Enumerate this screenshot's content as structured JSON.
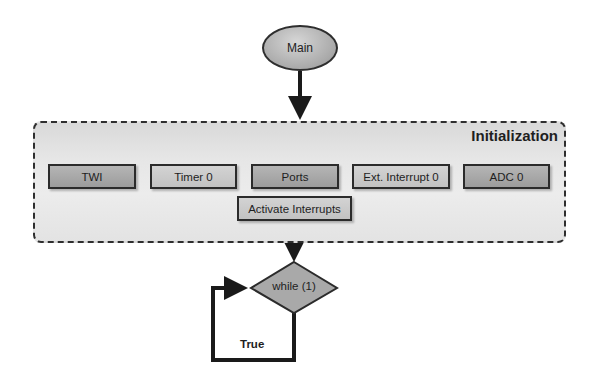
{
  "diagram": {
    "start_node": {
      "label": "Main",
      "shape": "ellipse"
    },
    "group": {
      "title": "Initialization",
      "nodes": [
        {
          "id": "twi",
          "label": "TWI"
        },
        {
          "id": "timer0",
          "label": "Timer 0"
        },
        {
          "id": "ports",
          "label": "Ports"
        },
        {
          "id": "ext_int0",
          "label": "Ext. Interrupt 0"
        },
        {
          "id": "adc0",
          "label": "ADC 0"
        }
      ],
      "sub_node": {
        "id": "activate_interrupts",
        "label": "Activate Interrupts",
        "attached_to": "ports"
      }
    },
    "decision": {
      "label": "while (1)",
      "shape": "diamond"
    },
    "loop": {
      "label": "True"
    },
    "edges": [
      {
        "from": "Main",
        "to": "Initialization",
        "arrow": true
      },
      {
        "from": "Initialization",
        "to": "while (1)",
        "arrow": true
      },
      {
        "from": "while (1)",
        "to": "while (1)",
        "label": "True",
        "arrow": true
      }
    ],
    "colors": {
      "node_fill": "#a8a8a8",
      "node_border": "#2b2b2b",
      "group_fill": "#e6e6e6",
      "line": "#1a1a1a"
    }
  }
}
